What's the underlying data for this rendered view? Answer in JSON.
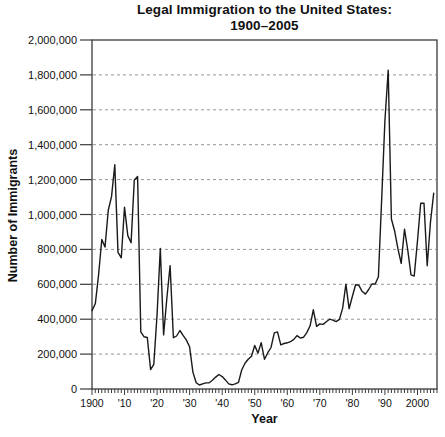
{
  "title": {
    "line1": "Legal Immigration to the United States:",
    "line2": "1900–2005"
  },
  "axes": {
    "y_label": "Number of Immigrants",
    "x_label": "Year",
    "y_ticks": [
      {
        "label": "2,000,000",
        "value": 2000000
      },
      {
        "label": "1,800,000",
        "value": 1800000
      },
      {
        "label": "1,600,000",
        "value": 1600000
      },
      {
        "label": "1,400,000",
        "value": 1400000
      },
      {
        "label": "1,200,000",
        "value": 1200000
      },
      {
        "label": "1,000,000",
        "value": 1000000
      },
      {
        "label": "800,000",
        "value": 800000
      },
      {
        "label": "600,000",
        "value": 600000
      },
      {
        "label": "400,000",
        "value": 400000
      },
      {
        "label": "200,000",
        "value": 200000
      },
      {
        "label": "0",
        "value": 0
      }
    ],
    "x_ticks": [
      {
        "label": "1900",
        "year": 1900
      },
      {
        "label": "'10",
        "year": 1910
      },
      {
        "label": "'20",
        "year": 1920
      },
      {
        "label": "'30",
        "year": 1930
      },
      {
        "label": "'40",
        "year": 1940
      },
      {
        "label": "'50",
        "year": 1950
      },
      {
        "label": "'60",
        "year": 1960
      },
      {
        "label": "'70",
        "year": 1970
      },
      {
        "label": "'80",
        "year": 1980
      },
      {
        "label": "'90",
        "year": 1990
      },
      {
        "label": "2000",
        "year": 2000
      }
    ]
  },
  "colors": {
    "line": "#1a1a1a",
    "axis": "#3a3a3a",
    "grid": "#969696",
    "text": "#111111",
    "background": "#ffffff"
  },
  "chart_data": {
    "type": "line",
    "title": "Legal Immigration to the United States: 1900–2005",
    "xlabel": "Year",
    "ylabel": "Number of Immigrants",
    "xlim": [
      1900,
      2006
    ],
    "ylim": [
      0,
      2000000
    ],
    "y_tick_step": 200000,
    "grid": "horizontal-dashed",
    "legend": "none",
    "x": [
      1900,
      1901,
      1902,
      1903,
      1904,
      1905,
      1906,
      1907,
      1908,
      1909,
      1910,
      1911,
      1912,
      1913,
      1914,
      1915,
      1916,
      1917,
      1918,
      1919,
      1920,
      1921,
      1922,
      1923,
      1924,
      1925,
      1926,
      1927,
      1928,
      1929,
      1930,
      1931,
      1932,
      1933,
      1934,
      1935,
      1936,
      1937,
      1938,
      1939,
      1940,
      1941,
      1942,
      1943,
      1944,
      1945,
      1946,
      1947,
      1948,
      1949,
      1950,
      1951,
      1952,
      1953,
      1954,
      1955,
      1956,
      1957,
      1958,
      1959,
      1960,
      1961,
      1962,
      1963,
      1964,
      1965,
      1966,
      1967,
      1968,
      1969,
      1970,
      1971,
      1972,
      1973,
      1974,
      1975,
      1976,
      1977,
      1978,
      1979,
      1980,
      1981,
      1982,
      1983,
      1984,
      1985,
      1986,
      1987,
      1988,
      1989,
      1990,
      1991,
      1992,
      1993,
      1994,
      1995,
      1996,
      1997,
      1998,
      1999,
      2000,
      2001,
      2002,
      2003,
      2004,
      2005
    ],
    "values": [
      449000,
      488000,
      649000,
      857000,
      813000,
      1026000,
      1101000,
      1285000,
      783000,
      752000,
      1042000,
      879000,
      838000,
      1198000,
      1218000,
      327000,
      299000,
      295000,
      111000,
      141000,
      430000,
      805000,
      310000,
      523000,
      707000,
      294000,
      304000,
      335000,
      307000,
      280000,
      242000,
      97000,
      36000,
      23000,
      29000,
      35000,
      36000,
      50000,
      68000,
      83000,
      71000,
      52000,
      29000,
      24000,
      29000,
      38000,
      109000,
      147000,
      171000,
      188000,
      249000,
      206000,
      266000,
      170000,
      208000,
      238000,
      322000,
      327000,
      253000,
      261000,
      265000,
      271000,
      284000,
      306000,
      292000,
      297000,
      323000,
      362000,
      454000,
      359000,
      373000,
      370000,
      385000,
      400000,
      395000,
      386000,
      399000,
      462000,
      601000,
      460000,
      531000,
      597000,
      594000,
      560000,
      544000,
      570000,
      602000,
      602000,
      643000,
      1091000,
      1536000,
      1827000,
      974000,
      904000,
      804000,
      720000,
      916000,
      798000,
      654000,
      647000,
      850000,
      1064000,
      1064000,
      706000,
      958000,
      1122000
    ]
  }
}
